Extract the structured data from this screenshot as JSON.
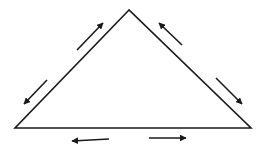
{
  "diagram": {
    "type": "triangle-with-force-arrows",
    "background": "#ffffff",
    "stroke_color": "#1a1a1a",
    "triangle": {
      "vertices": [
        [
          129,
          10
        ],
        [
          15,
          128
        ],
        [
          251,
          128
        ]
      ],
      "stroke_width": 1.6
    },
    "arrows": [
      {
        "name": "arrow-left-side-up",
        "from": [
          77,
          50
        ],
        "to": [
          103,
          23
        ]
      },
      {
        "name": "arrow-left-side-down",
        "from": [
          47,
          80
        ],
        "to": [
          24,
          104
        ]
      },
      {
        "name": "arrow-right-side-up",
        "from": [
          182,
          45
        ],
        "to": [
          159,
          23
        ]
      },
      {
        "name": "arrow-right-side-down",
        "from": [
          216,
          78
        ],
        "to": [
          242,
          104
        ]
      },
      {
        "name": "arrow-bottom-left",
        "from": [
          109,
          139
        ],
        "to": [
          72,
          141
        ]
      },
      {
        "name": "arrow-bottom-right",
        "from": [
          149,
          138
        ],
        "to": [
          186,
          138
        ]
      }
    ]
  }
}
